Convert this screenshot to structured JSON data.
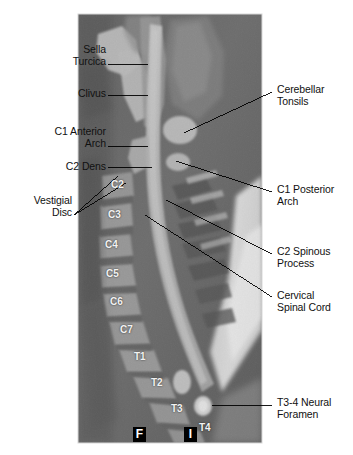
{
  "figure": {
    "type": "sagittal-mri-cervical-spine",
    "caption": "",
    "image_region": {
      "x": 78,
      "y": 14,
      "width": 184,
      "height": 429
    }
  },
  "left_labels": [
    {
      "id": "sella-turcica",
      "text": "Sella\nTurcica",
      "x": 18,
      "y": 46,
      "w": 88,
      "leader": {
        "x1": 108,
        "y1": 64,
        "x2": 148,
        "y2": 64
      }
    },
    {
      "id": "clivus",
      "text": "Clivus",
      "x": 18,
      "y": 90,
      "w": 88,
      "leader": {
        "x1": 108,
        "y1": 95,
        "x2": 148,
        "y2": 95
      }
    },
    {
      "id": "c1-anterior-arch",
      "text": "C1 Anterior\nArch",
      "x": 8,
      "y": 126,
      "w": 98,
      "leader": {
        "x1": 108,
        "y1": 146,
        "x2": 148,
        "y2": 146
      }
    },
    {
      "id": "c2-dens",
      "text": "C2 Dens",
      "x": 18,
      "y": 162,
      "w": 88,
      "leader": {
        "x1": 108,
        "y1": 167,
        "x2": 148,
        "y2": 167
      }
    },
    {
      "id": "vestigial-disc",
      "text": "Vestigial\nDisc",
      "x": 18,
      "y": 196,
      "w": 88,
      "leader": {
        "x1": 74,
        "y1": 215,
        "x2": 122,
        "y2": 185
      }
    }
  ],
  "right_labels": [
    {
      "id": "cerebellar-tonsils",
      "text": "Cerebellar\nTonsils",
      "x": 276,
      "y": 85,
      "w": 74,
      "leader": {
        "x1": 272,
        "y1": 92,
        "x2": 184,
        "y2": 133
      }
    },
    {
      "id": "c1-posterior-arch",
      "text": "C1 Posterior\nArch",
      "x": 276,
      "y": 185,
      "w": 74,
      "leader": {
        "x1": 272,
        "y1": 192,
        "x2": 174,
        "y2": 162
      }
    },
    {
      "id": "c2-spinous-process",
      "text": "C2 Spinous\nProcess",
      "x": 276,
      "y": 248,
      "w": 74,
      "leader": {
        "x1": 272,
        "y1": 254,
        "x2": 168,
        "y2": 199
      }
    },
    {
      "id": "cervical-spinal-cord",
      "text": "Cervical\nSpinal Cord",
      "x": 276,
      "y": 292,
      "w": 74,
      "leader": {
        "x1": 272,
        "y1": 297,
        "x2": 146,
        "y2": 215
      }
    },
    {
      "id": "t3-4-neural-foramen",
      "text": "T3-4 Neural\nForamen",
      "x": 276,
      "y": 398,
      "w": 74,
      "leader": {
        "x1": 272,
        "y1": 405,
        "x2": 216,
        "y2": 405
      }
    }
  ],
  "vertebra_labels": [
    {
      "id": "c2",
      "text": "C2",
      "x": 111,
      "y": 184
    },
    {
      "id": "c3",
      "text": "C3",
      "x": 108,
      "y": 214
    },
    {
      "id": "c4",
      "text": "C4",
      "x": 105,
      "y": 244
    },
    {
      "id": "c5",
      "text": "C5",
      "x": 106,
      "y": 272
    },
    {
      "id": "c6",
      "text": "C6",
      "x": 110,
      "y": 300
    },
    {
      "id": "c7",
      "text": "C7",
      "x": 119,
      "y": 328
    },
    {
      "id": "t1",
      "text": "T1",
      "x": 133,
      "y": 355
    },
    {
      "id": "t2",
      "text": "T2",
      "x": 150,
      "y": 380
    },
    {
      "id": "t3",
      "text": "T3",
      "x": 170,
      "y": 407
    },
    {
      "id": "t4",
      "text": "T4",
      "x": 198,
      "y": 426
    }
  ],
  "corner_marks": [
    {
      "id": "mark-f",
      "text": "F",
      "x": 133,
      "y": 427
    },
    {
      "id": "mark-i",
      "text": "I",
      "x": 184,
      "y": 427
    }
  ],
  "colors": {
    "background": "#ffffff",
    "label_text": "#111111",
    "leader_line": "#000000",
    "vertebra_text": "#f2f2f2",
    "mark_bg": "#000000",
    "mark_text": "#ffffff",
    "mri_dark": "#3a3a3a",
    "mri_mid": "#6e6e6e",
    "mri_light": "#b9b9b9",
    "mri_bright": "#ededed"
  }
}
